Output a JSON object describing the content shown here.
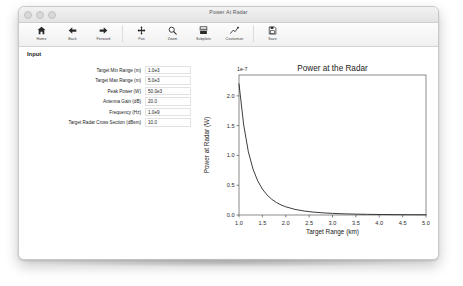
{
  "window": {
    "title": "Power At Radar",
    "traffic_lights": [
      "close-light",
      "minimize-light",
      "zoom-light"
    ]
  },
  "toolbar": {
    "groups": [
      [
        {
          "label": "Home",
          "icon": "home-icon"
        },
        {
          "label": "Back",
          "icon": "arrow-left-icon"
        },
        {
          "label": "Forward",
          "icon": "arrow-right-icon"
        }
      ],
      [
        {
          "label": "Pan",
          "icon": "pan-move-icon"
        },
        {
          "label": "Zoom",
          "icon": "magnifier-icon"
        },
        {
          "label": "Subplots",
          "icon": "subplots-icon"
        },
        {
          "label": "Customize",
          "icon": "customize-chart-icon"
        }
      ],
      [
        {
          "label": "Save",
          "icon": "floppy-save-icon"
        }
      ]
    ]
  },
  "panel": {
    "section_title": "Input",
    "fields": [
      {
        "label": "Target Min Range (m)",
        "value": "1.0e3",
        "name": "target-min-range"
      },
      {
        "label": "Target Max Range (m)",
        "value": "5.0e3",
        "name": "target-max-range"
      },
      {
        "label": "Peak Power (W)",
        "value": "50.0e3",
        "name": "peak-power"
      },
      {
        "label": "Antenna Gain (dB)",
        "value": "20.0",
        "name": "antenna-gain"
      },
      {
        "label": "Frequency (Hz)",
        "value": "1.0e9",
        "name": "frequency"
      },
      {
        "label": "Target Radar Cross Section (dBsm)",
        "value": "10.0",
        "name": "target-rcs"
      }
    ]
  },
  "chart_data": {
    "type": "line",
    "title": "Power at the Radar",
    "xlabel": "Target Range (km)",
    "ylabel": "Power at Radar (W)",
    "y_offset_text": "1e-7",
    "xlim": [
      1.0,
      5.0
    ],
    "ylim": [
      0.0,
      2.35
    ],
    "xticks": [
      "1.0",
      "1.5",
      "2.0",
      "2.5",
      "3.0",
      "3.5",
      "4.0",
      "4.5",
      "5.0"
    ],
    "yticks": [
      "0.0",
      "0.5",
      "1.0",
      "1.5",
      "2.0"
    ],
    "grid": false,
    "legend": "none",
    "line_color": "#1a1a1a",
    "series": [
      {
        "name": "Power at Radar",
        "x": [
          1.0,
          1.1,
          1.2,
          1.3,
          1.4,
          1.5,
          1.6,
          1.7,
          1.8,
          1.9,
          2.0,
          2.2,
          2.4,
          2.6,
          2.8,
          3.0,
          3.25,
          3.5,
          3.75,
          4.0,
          4.25,
          4.5,
          4.75,
          5.0
        ],
        "values": [
          2.2,
          1.512,
          1.061,
          0.77,
          0.573,
          0.435,
          0.336,
          0.264,
          0.21,
          0.169,
          0.1375,
          0.0939,
          0.0663,
          0.0481,
          0.0358,
          0.0272,
          0.0197,
          0.0147,
          0.0112,
          0.0086,
          0.0067,
          0.0054,
          0.0043,
          0.0035
        ]
      }
    ]
  }
}
